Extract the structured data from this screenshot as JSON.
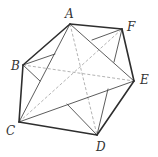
{
  "diagram": {
    "type": "polyhedron-projection",
    "vertices": {
      "A": {
        "x": 70,
        "y": 24,
        "label": "A",
        "lx": 65,
        "ly": 18
      },
      "B": {
        "x": 23,
        "y": 65,
        "label": "B",
        "lx": 11,
        "ly": 70
      },
      "C": {
        "x": 19,
        "y": 122,
        "label": "C",
        "lx": 6,
        "ly": 135
      },
      "D": {
        "x": 97,
        "y": 135,
        "label": "D",
        "lx": 96,
        "ly": 151
      },
      "E": {
        "x": 134,
        "y": 81,
        "label": "E",
        "lx": 140,
        "ly": 84
      },
      "F": {
        "x": 122,
        "y": 29,
        "label": "F",
        "lx": 127,
        "ly": 31
      }
    },
    "outer_edges": [
      [
        "A",
        "F"
      ],
      [
        "F",
        "E"
      ],
      [
        "E",
        "D"
      ],
      [
        "D",
        "C"
      ],
      [
        "C",
        "B"
      ],
      [
        "B",
        "A"
      ]
    ],
    "inner_solid_edges": [
      [
        "A",
        "C"
      ],
      [
        "A",
        "E"
      ],
      [
        "C",
        "E"
      ]
    ],
    "partial_solid_segments": [
      {
        "from": "B",
        "toward": "F",
        "x2": 55,
        "y2": 54
      },
      {
        "from": "F",
        "toward": "B",
        "x2": 92,
        "y2": 40
      },
      {
        "from": "B",
        "toward": "D",
        "x2": 40,
        "y2": 81
      },
      {
        "from": "D",
        "toward": "B",
        "x2": 67,
        "y2": 104
      },
      {
        "from": "F",
        "toward": "D",
        "x2": 114,
        "y2": 62
      },
      {
        "from": "D",
        "toward": "F",
        "x2": 108,
        "y2": 89
      }
    ],
    "hidden_edges": [
      [
        "B",
        "E"
      ],
      [
        "A",
        "D"
      ],
      [
        "C",
        "F"
      ]
    ],
    "colors": {
      "outer": "#2e2e2e",
      "inner": "#4a4a4a",
      "hidden": "#a0a0a0"
    }
  }
}
